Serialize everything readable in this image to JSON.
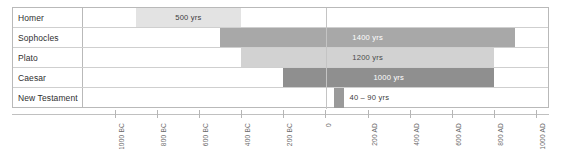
{
  "chart_data": {
    "type": "bar",
    "title": "",
    "subtitle": "",
    "xlabel": "",
    "ylabel": "",
    "orientation": "horizontal",
    "grid": false,
    "legend": "none",
    "xlim": [
      -1150,
      1060
    ],
    "xunit": "year",
    "axis_ticks": [
      {
        "value": -1000,
        "label": "1000 BC"
      },
      {
        "value": -800,
        "label": "800 BC"
      },
      {
        "value": -600,
        "label": "600 BC"
      },
      {
        "value": -400,
        "label": "400 BC"
      },
      {
        "value": -200,
        "label": "200 BC"
      },
      {
        "value": 0,
        "label": "0"
      },
      {
        "value": 200,
        "label": "200 AD"
      },
      {
        "value": 400,
        "label": "400 AD"
      },
      {
        "value": 600,
        "label": "600 AD"
      },
      {
        "value": 800,
        "label": "800 AD"
      },
      {
        "value": 1000,
        "label": "1000 AD"
      }
    ],
    "categories": [
      "Homer",
      "Sophocles",
      "Plato",
      "Caesar",
      "New Testament"
    ],
    "bars": [
      {
        "category": "Homer",
        "label": "500 yrs",
        "gap_years": 500,
        "start_year": -900,
        "end_year": -400,
        "color": "#e3e3e3",
        "text_color": "#3c3c3c",
        "text_position": "inside"
      },
      {
        "category": "Sophocles",
        "label": "1400 yrs",
        "gap_years": 1400,
        "start_year": -500,
        "end_year": 900,
        "color": "#a8a8a8",
        "text_color": "#ffffff",
        "text_position": "inside"
      },
      {
        "category": "Plato",
        "label": "1200 yrs",
        "gap_years": 1200,
        "start_year": -400,
        "end_year": 800,
        "color": "#d2d2d2",
        "text_color": "#4a4a4a",
        "text_position": "inside"
      },
      {
        "category": "Caesar",
        "label": "1000 yrs",
        "gap_years": 1000,
        "start_year": -200,
        "end_year": 800,
        "color": "#8f8f8f",
        "text_color": "#ffffff",
        "text_position": "inside"
      },
      {
        "category": "New Testament",
        "label": "40 – 90 yrs",
        "gap_years": 50,
        "start_year": 40,
        "end_year": 90,
        "color": "#9a9a9a",
        "text_color": "#3c3c3c",
        "text_position": "outside"
      }
    ]
  },
  "colors": {
    "frame_border": "#b9b9b9",
    "row_divider": "#cfcfcf",
    "axis_line": "#c0c0c0",
    "tick": "#b5b5b5",
    "tick_label": "#6a6a6a",
    "zero_gridline": "#c4c4c4",
    "row_label_text": "#2f2f2f",
    "background": "#ffffff"
  }
}
